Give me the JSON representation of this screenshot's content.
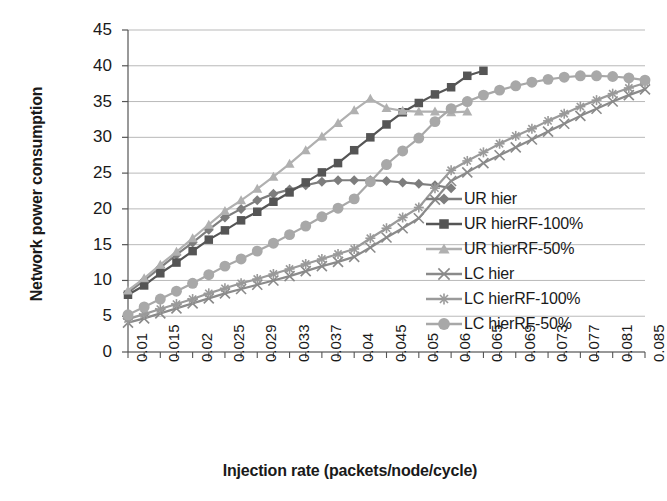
{
  "chart_data": {
    "type": "line",
    "title": "",
    "xlabel": "Injection rate (packets/node/cycle)",
    "ylabel": "Network power consumption",
    "grid": true,
    "legend_position": "right-middle",
    "ylim": [
      0,
      45
    ],
    "yticks": [
      0,
      5,
      10,
      15,
      20,
      25,
      30,
      35,
      40,
      45
    ],
    "xticks": [
      "0.01",
      "0.015",
      "0.02",
      "0.025",
      "0.029",
      "0.033",
      "0.037",
      "0.04",
      "0.045",
      "0.05",
      "0.06",
      "0.065",
      "0.069",
      "0.073",
      "0.077",
      "0.081",
      "0.085"
    ],
    "x": [
      0.01,
      0.0125,
      0.015,
      0.0175,
      0.02,
      0.0225,
      0.025,
      0.027,
      0.029,
      0.031,
      0.033,
      0.035,
      0.037,
      0.0385,
      0.04,
      0.0425,
      0.045,
      0.0475,
      0.05,
      0.055,
      0.06,
      0.0625,
      0.065,
      0.067,
      0.069,
      0.071,
      0.073,
      0.075,
      0.077,
      0.079,
      0.081,
      0.083,
      0.085
    ],
    "series": [
      {
        "name": "UR hier",
        "marker": "diamond",
        "color": "#7d7d7d",
        "values": [
          8.3,
          10.0,
          11.8,
          13.6,
          15.3,
          17.1,
          18.8,
          20.0,
          21.2,
          22.1,
          22.7,
          23.3,
          23.8,
          24.0,
          24.0,
          24.0,
          23.9,
          23.7,
          23.5,
          23.3,
          22.9,
          null,
          null,
          null,
          null,
          null,
          null,
          null,
          null,
          null,
          null,
          null,
          null
        ]
      },
      {
        "name": "UR hierRF-100%",
        "marker": "square",
        "color": "#555555",
        "values": [
          8.0,
          9.3,
          11.0,
          12.5,
          14.1,
          15.7,
          17.0,
          18.4,
          19.6,
          21.0,
          22.3,
          23.7,
          25.1,
          26.4,
          28.2,
          30.0,
          31.8,
          33.5,
          34.8,
          36.0,
          37.0,
          38.6,
          39.3,
          null,
          null,
          null,
          null,
          null,
          null,
          null,
          null,
          null,
          null
        ]
      },
      {
        "name": "UR hierRF-50%",
        "marker": "triangle",
        "color": "#b0b0b0",
        "values": [
          8.6,
          10.3,
          12.2,
          14.0,
          15.9,
          17.8,
          19.7,
          21.2,
          22.8,
          24.5,
          26.3,
          28.2,
          30.1,
          32.0,
          33.8,
          35.4,
          34.1,
          33.7,
          33.6,
          33.6,
          33.5,
          33.6,
          null,
          null,
          null,
          null,
          null,
          null,
          null,
          null,
          null,
          null,
          null
        ]
      },
      {
        "name": "LC hier",
        "marker": "x",
        "color": "#8a8a8a",
        "values": [
          4.1,
          4.7,
          5.4,
          6.1,
          6.8,
          7.5,
          8.2,
          8.8,
          9.4,
          10.0,
          10.6,
          11.3,
          12.0,
          12.6,
          13.3,
          14.6,
          16.0,
          17.3,
          18.7,
          21.3,
          23.9,
          25.1,
          26.4,
          27.5,
          28.6,
          29.7,
          30.8,
          31.9,
          33.0,
          34.0,
          35.0,
          35.9,
          36.7
        ]
      },
      {
        "name": "LC hierRF-100%",
        "marker": "asterisk",
        "color": "#9a9a9a",
        "values": [
          4.6,
          5.3,
          6.0,
          6.7,
          7.4,
          8.2,
          8.9,
          9.6,
          10.2,
          10.9,
          11.6,
          12.3,
          13.0,
          13.7,
          14.4,
          15.9,
          17.3,
          18.8,
          20.2,
          22.9,
          25.4,
          26.7,
          27.9,
          29.1,
          30.2,
          31.2,
          32.3,
          33.3,
          34.3,
          35.2,
          36.1,
          36.9,
          37.6
        ]
      },
      {
        "name": "LC hierRF-50%",
        "marker": "circle",
        "color": "#a8a8a8",
        "values": [
          5.2,
          6.3,
          7.4,
          8.5,
          9.6,
          10.8,
          12.0,
          13.0,
          14.1,
          15.2,
          16.4,
          17.6,
          18.9,
          20.1,
          21.4,
          23.8,
          26.2,
          28.1,
          29.9,
          32.2,
          34.0,
          35.0,
          35.9,
          36.6,
          37.2,
          37.7,
          38.1,
          38.4,
          38.6,
          38.6,
          38.5,
          38.3,
          38.0
        ]
      }
    ]
  },
  "legend": {
    "items": [
      {
        "label": "UR hier"
      },
      {
        "label": "UR hierRF-100%"
      },
      {
        "label": "UR hierRF-50%"
      },
      {
        "label": "LC hier"
      },
      {
        "label": "LC hierRF-100%"
      },
      {
        "label": "LC hierRF-50%"
      }
    ]
  },
  "axes": {
    "x_title": "Injection rate (packets/node/cycle)",
    "y_title": "Network power consumption"
  }
}
